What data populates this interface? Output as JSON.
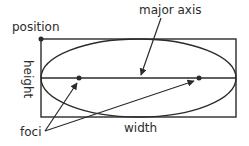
{
  "diagram": {
    "labels": {
      "position": "position",
      "major_axis": "major axis",
      "height": "height",
      "width": "width",
      "foci": "foci"
    },
    "colors": {
      "stroke": "#2b2b2b",
      "background": "#ffffff"
    }
  }
}
